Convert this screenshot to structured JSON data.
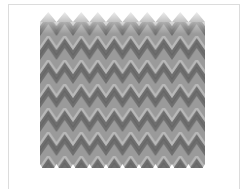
{
  "image": {
    "subject": "zigzag-chevron-pattern",
    "description": "Grayscale bargello-style zigzag pattern in a thin bordered frame",
    "peaks_per_row": 10,
    "rows": 7,
    "colors": {
      "background": "#ffffff",
      "frame_border": "#dcdcdc",
      "dark": "#6e6e6e",
      "mid": "#8f8f8f",
      "light": "#b8b8b8"
    }
  },
  "caption": {
    "text": ""
  }
}
